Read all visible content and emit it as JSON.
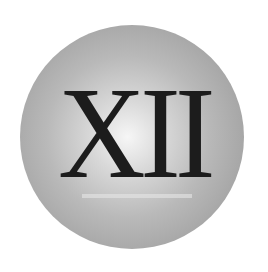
{
  "badge": {
    "numeral": "XII",
    "colors": {
      "background": "#ffffff",
      "disc_highlight": "#f6f6f6",
      "disc_edge": "#959595",
      "numeral": "#1c1c1c"
    }
  }
}
